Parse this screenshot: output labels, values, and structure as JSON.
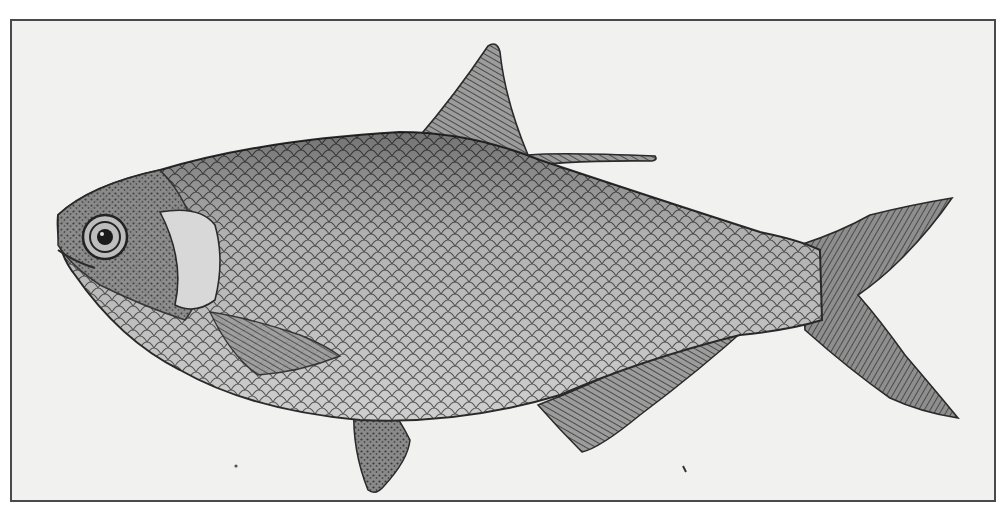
{
  "image": {
    "subject": "fish-engraving",
    "style": "black-and-white scientific illustration",
    "background_color": "#f1f1f0",
    "frame_color": "#4a4a4a",
    "ink_color": "#2a2a2a",
    "body_shade": "#9a9a9a",
    "belly_shade": "#d6d6d6"
  },
  "parts": [
    {
      "name": "head",
      "label": "Head"
    },
    {
      "name": "eye",
      "label": "Eye"
    },
    {
      "name": "gill-cover",
      "label": "Operculum"
    },
    {
      "name": "dorsal-fin",
      "label": "Dorsal fin with filament"
    },
    {
      "name": "pectoral-fin",
      "label": "Pectoral fin"
    },
    {
      "name": "pelvic-fin",
      "label": "Pelvic fin"
    },
    {
      "name": "anal-fin",
      "label": "Anal fin"
    },
    {
      "name": "caudal-fin",
      "label": "Forked tail"
    }
  ]
}
